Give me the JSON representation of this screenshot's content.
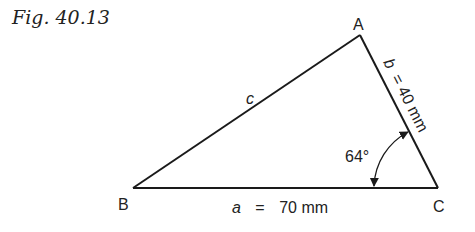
{
  "figure": {
    "title": "Fig. 40.13"
  },
  "triangle": {
    "vertices": {
      "A": {
        "label": "A"
      },
      "B": {
        "label": "B"
      },
      "C": {
        "label": "C"
      }
    },
    "sides": {
      "a": {
        "name": "a",
        "eq": "=",
        "value": "70 mm"
      },
      "b": {
        "name": "b",
        "text": "b = 40 mm"
      },
      "c": {
        "name": "c"
      }
    },
    "angle_C": {
      "label": "64°"
    }
  },
  "colors": {
    "line": "#1a1a1a",
    "text": "#222222"
  }
}
